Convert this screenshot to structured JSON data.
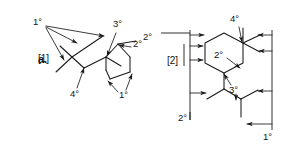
{
  "figure": {
    "panel_label": "a.",
    "width": 282,
    "height": 148,
    "background_color": "#ffffff",
    "ink_color": "#1a1a1a"
  },
  "structures": [
    {
      "id": "structure-1",
      "tag": "[1]",
      "tag_x": 38,
      "tag_y": 59,
      "annotations": [
        {
          "name": "primary-top-left",
          "text": "1°",
          "x": 33,
          "y": 25
        },
        {
          "name": "quaternary-bottom",
          "text": "4°",
          "x": 71,
          "y": 95
        },
        {
          "name": "tertiary-top-right",
          "text": "3°",
          "x": 115,
          "y": 26
        },
        {
          "name": "secondary-right",
          "text": "2°",
          "x": 133,
          "y": 45
        },
        {
          "name": "primary-bottom-right",
          "text": "1°",
          "x": 119,
          "y": 96
        }
      ]
    },
    {
      "id": "structure-2",
      "tag": "[2]",
      "tag_x": 170,
      "tag_y": 61,
      "annotations": [
        {
          "name": "secondary-far-left",
          "text": "2°",
          "x": 143,
          "y": 38
        },
        {
          "name": "secondary-ring",
          "text": "2°",
          "x": 216,
          "y": 56
        },
        {
          "name": "quaternary-top",
          "text": "4°",
          "x": 232,
          "y": 21
        },
        {
          "name": "tertiary-mid",
          "text": "3°",
          "x": 231,
          "y": 91
        },
        {
          "name": "secondary-bottom-left",
          "text": "2°",
          "x": 179,
          "y": 119
        },
        {
          "name": "primary-bottom-right",
          "text": "1°",
          "x": 266,
          "y": 138
        }
      ]
    }
  ],
  "legend": {
    "degree_symbol": "°",
    "classes": [
      "1°",
      "2°",
      "3°",
      "4°"
    ]
  }
}
